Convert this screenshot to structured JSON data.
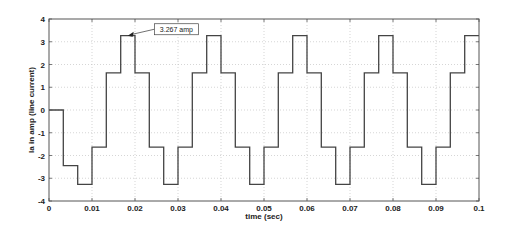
{
  "chart_data": {
    "type": "line",
    "title": "",
    "xlabel": "time (sec)",
    "ylabel": "Ia in amp (line current)",
    "xlim": [
      0,
      0.1
    ],
    "ylim": [
      -4,
      4
    ],
    "grid": true,
    "legend": null,
    "x_ticks": [
      0,
      0.01,
      0.02,
      0.03,
      0.04,
      0.05,
      0.06,
      0.07,
      0.08,
      0.09,
      0.1
    ],
    "x_tick_labels": [
      "0",
      "0.01",
      "0.02",
      "0.03",
      "0.04",
      "0.05",
      "0.06",
      "0.07",
      "0.08",
      "0.09",
      "0.1"
    ],
    "y_ticks": [
      -4,
      -3,
      -2,
      -1,
      0,
      1,
      2,
      3,
      4
    ],
    "y_tick_labels": [
      "-4",
      "-3",
      "-2",
      "-1",
      "0",
      "1",
      "2",
      "3",
      "4"
    ],
    "series": [
      {
        "name": "Ia (line current)",
        "style": "step",
        "color": "#444444",
        "x": [
          0,
          0.00333,
          0.00333,
          0.00667,
          0.00667,
          0.01,
          0.01,
          0.01333,
          0.01333,
          0.01667,
          0.01667,
          0.02,
          0.02,
          0.02333,
          0.02333,
          0.02667,
          0.02667,
          0.03,
          0.03,
          0.03333,
          0.03333,
          0.03667,
          0.03667,
          0.04,
          0.04,
          0.04333,
          0.04333,
          0.04667,
          0.04667,
          0.05,
          0.05,
          0.05333,
          0.05333,
          0.05667,
          0.05667,
          0.06,
          0.06,
          0.06333,
          0.06333,
          0.06667,
          0.06667,
          0.07,
          0.07,
          0.07333,
          0.07333,
          0.07667,
          0.07667,
          0.08,
          0.08,
          0.08333,
          0.08333,
          0.08667,
          0.08667,
          0.09,
          0.09,
          0.09333,
          0.09333,
          0.09667,
          0.09667,
          0.1
        ],
        "y": [
          0,
          0,
          -2.45,
          -2.45,
          -3.267,
          -3.267,
          -1.633,
          -1.633,
          1.633,
          1.633,
          3.267,
          3.267,
          1.633,
          1.633,
          -1.633,
          -1.633,
          -3.267,
          -3.267,
          -1.633,
          -1.633,
          1.633,
          1.633,
          3.267,
          3.267,
          1.633,
          1.633,
          -1.633,
          -1.633,
          -3.267,
          -3.267,
          -1.633,
          -1.633,
          1.633,
          1.633,
          3.267,
          3.267,
          1.633,
          1.633,
          -1.633,
          -1.633,
          -3.267,
          -3.267,
          -1.633,
          -1.633,
          1.633,
          1.633,
          3.267,
          3.267,
          1.633,
          1.633,
          -1.633,
          -1.633,
          -3.267,
          -3.267,
          -1.633,
          -1.633,
          1.633,
          1.633,
          3.267,
          3.267
        ]
      }
    ],
    "annotations": [
      {
        "text": "3.267 amp",
        "x": 0.0183,
        "y": 3.267,
        "label_x": 0.0245,
        "label_y": 3.55
      }
    ]
  }
}
